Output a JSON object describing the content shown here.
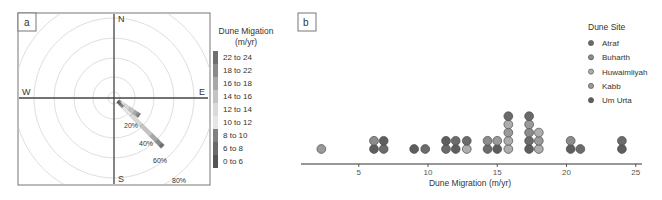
{
  "chart_data": [
    {
      "panel": "a",
      "type": "wind_rose",
      "title": "",
      "directions": [
        "N",
        "E",
        "S",
        "W"
      ],
      "ring_labels": [
        "20%",
        "40%",
        "60%",
        "80%"
      ],
      "rings_pct": [
        20,
        40,
        60,
        80
      ],
      "legend_title_line1": "Dune Migation",
      "legend_title_line2": "(m/yr)",
      "bins": [
        "22 to 24",
        "18 to 22",
        "16 to 18",
        "14 to 16",
        "12 to 14",
        "10 to 12",
        "8 to 10",
        "6 to 8",
        "0 to 6"
      ],
      "bin_colors": [
        "#6e6e6e",
        "#8a8a8a",
        "#a8a8a8",
        "#c4c4c4",
        "#dadada",
        "#e6e6e6",
        "#808080",
        "#6a6a6a",
        "#555555"
      ],
      "petals": [
        {
          "bearing_deg": 125,
          "frequency_pct": 31
        },
        {
          "bearing_deg": 135,
          "frequency_pct": 69
        }
      ]
    },
    {
      "panel": "b",
      "type": "scatter",
      "subtype": "dot_plot",
      "xlabel": "Dune Migration (m/yr)",
      "ylabel": "",
      "xlim": [
        0,
        25.5
      ],
      "xticks": [
        5,
        10,
        15,
        20,
        25
      ],
      "grid": false,
      "legend_title": "Dune Site",
      "legend_position": "upper right",
      "series": [
        {
          "name": "Atraf",
          "color": "#6b6b6b"
        },
        {
          "name": "Buharth",
          "color": "#8c8c8c"
        },
        {
          "name": "Huwaimliyah",
          "color": "#adadad"
        },
        {
          "name": "Kabb",
          "color": "#9a9a9a"
        },
        {
          "name": "Um Urta",
          "color": "#5e5e5e"
        }
      ],
      "stacks": [
        {
          "x": 2.3,
          "sites": [
            "Kabb"
          ]
        },
        {
          "x": 6.1,
          "sites": [
            "Um Urta",
            "Buharth"
          ]
        },
        {
          "x": 6.8,
          "sites": [
            "Atraf",
            "Um Urta"
          ]
        },
        {
          "x": 9.0,
          "sites": [
            "Um Urta"
          ]
        },
        {
          "x": 9.8,
          "sites": [
            "Atraf"
          ]
        },
        {
          "x": 11.3,
          "sites": [
            "Atraf",
            "Um Urta"
          ]
        },
        {
          "x": 12.0,
          "sites": [
            "Um Urta",
            "Atraf"
          ]
        },
        {
          "x": 12.8,
          "sites": [
            "Huwaimliyah",
            "Atraf"
          ]
        },
        {
          "x": 14.3,
          "sites": [
            "Atraf",
            "Buharth"
          ]
        },
        {
          "x": 15.0,
          "sites": [
            "Um Urta",
            "Kabb"
          ]
        },
        {
          "x": 15.8,
          "sites": [
            "Huwaimliyah",
            "Huwaimliyah",
            "Kabb",
            "Huwaimliyah",
            "Atraf"
          ]
        },
        {
          "x": 17.3,
          "sites": [
            "Um Urta",
            "Atraf",
            "Buharth",
            "Kabb",
            "Atraf"
          ]
        },
        {
          "x": 18.0,
          "sites": [
            "Huwaimliyah",
            "Kabb",
            "Huwaimliyah"
          ]
        },
        {
          "x": 20.3,
          "sites": [
            "Um Urta",
            "Buharth"
          ]
        },
        {
          "x": 21.0,
          "sites": [
            "Atraf"
          ]
        },
        {
          "x": 24.0,
          "sites": [
            "Um Urta",
            "Atraf"
          ]
        }
      ]
    }
  ],
  "panels": {
    "a": {
      "label": "a"
    },
    "b": {
      "label": "b"
    }
  }
}
